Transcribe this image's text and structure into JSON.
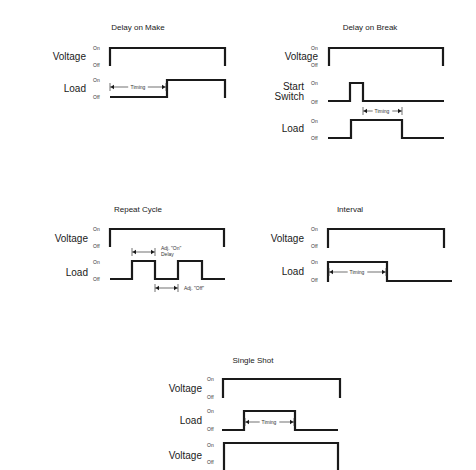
{
  "colors": {
    "line": "#1a1a1a",
    "background": "#ffffff"
  },
  "diagrams": [
    {
      "id": "delay-on-make",
      "title": "Delay on Make",
      "title_pos": [
        138,
        30
      ],
      "signals": [
        {
          "label": [
            "Voltage"
          ],
          "label_x": 86,
          "label_y": 60,
          "on_y": 50,
          "off_y": 67,
          "state_x": 93,
          "path": [
            [
              110,
              66
            ],
            [
              110,
              48
            ],
            [
              225,
              48
            ],
            [
              225,
              66
            ]
          ]
        },
        {
          "label": [
            "Load"
          ],
          "label_x": 86,
          "label_y": 92,
          "on_y": 82,
          "off_y": 99,
          "state_x": 93,
          "path": [
            [
              110,
              97
            ],
            [
              167,
              97
            ],
            [
              167,
              80
            ],
            [
              225,
              80
            ],
            [
              225,
              98
            ]
          ]
        }
      ],
      "dims": [
        {
          "x1": 110,
          "x2": 166,
          "y": 87,
          "text": "Timing",
          "text_x": 138,
          "text_y": 89,
          "inline": true,
          "tick_x1": true
        }
      ]
    },
    {
      "id": "delay-on-break",
      "title": "Delay on Break",
      "title_pos": [
        370,
        30
      ],
      "signals": [
        {
          "label": [
            "Voltage"
          ],
          "label_x": 318,
          "label_y": 60,
          "on_y": 50,
          "off_y": 67,
          "state_x": 311,
          "path": [
            [
              329,
              66
            ],
            [
              329,
              48
            ],
            [
              443,
              48
            ],
            [
              443,
              66
            ]
          ]
        },
        {
          "label": [
            "Start",
            "Switch"
          ],
          "label_x": 304,
          "label_y": 90,
          "on_y": 85,
          "off_y": 104,
          "state_x": 311,
          "path": [
            [
              328,
              101
            ],
            [
              350,
              101
            ],
            [
              350,
              83
            ],
            [
              363,
              83
            ],
            [
              363,
              101
            ],
            [
              444,
              101
            ]
          ]
        },
        {
          "label": [
            "Load"
          ],
          "label_x": 304,
          "label_y": 132,
          "on_y": 123,
          "off_y": 140,
          "state_x": 311,
          "path": [
            [
              328,
              138
            ],
            [
              351,
              138
            ],
            [
              351,
              120
            ],
            [
              402,
              120
            ],
            [
              402,
              138
            ],
            [
              444,
              138
            ]
          ]
        }
      ],
      "dims": [
        {
          "x1": 363,
          "x2": 402,
          "y": 111,
          "text": "Timing",
          "text_x": 382,
          "text_y": 113,
          "inline": true
        }
      ]
    },
    {
      "id": "repeat-cycle",
      "title": "Repeat Cycle",
      "title_pos": [
        138,
        212
      ],
      "signals": [
        {
          "label": [
            "Voltage"
          ],
          "label_x": 88,
          "label_y": 242,
          "on_y": 231,
          "off_y": 248,
          "state_x": 93,
          "path": [
            [
              110,
              247
            ],
            [
              110,
              229
            ],
            [
              224,
              229
            ],
            [
              224,
              247
            ]
          ]
        },
        {
          "label": [
            "Load"
          ],
          "label_x": 88,
          "label_y": 276,
          "on_y": 264,
          "off_y": 281,
          "state_x": 93,
          "path": [
            [
              110,
              279
            ],
            [
              132,
              279
            ],
            [
              132,
              261
            ],
            [
              155,
              261
            ],
            [
              155,
              279
            ],
            [
              178,
              279
            ],
            [
              178,
              261
            ],
            [
              202,
              261
            ],
            [
              202,
              279
            ],
            [
              225,
              279
            ]
          ]
        }
      ],
      "dims": [
        {
          "x1": 132,
          "x2": 155,
          "y": 252,
          "text": "Adj. \"On\"",
          "text2": "Delay",
          "text_x": 161,
          "text_y": 250,
          "inline": false
        },
        {
          "x1": 155,
          "x2": 178,
          "y": 288,
          "text": "Adj. \"Off\"",
          "text_x": 184,
          "text_y": 290,
          "inline": false
        }
      ]
    },
    {
      "id": "interval",
      "title": "Interval",
      "title_pos": [
        350,
        212
      ],
      "signals": [
        {
          "label": [
            "Voltage"
          ],
          "label_x": 304,
          "label_y": 242,
          "on_y": 231,
          "off_y": 248,
          "state_x": 311,
          "path": [
            [
              328,
              248
            ],
            [
              328,
              229
            ],
            [
              444,
              229
            ],
            [
              444,
              248
            ]
          ]
        },
        {
          "label": [
            "Load"
          ],
          "label_x": 304,
          "label_y": 275,
          "on_y": 264,
          "off_y": 282,
          "state_x": 311,
          "path": [
            [
              328,
              282
            ],
            [
              328,
              262
            ],
            [
              387,
              262
            ],
            [
              387,
              281
            ],
            [
              452,
              281
            ]
          ]
        }
      ],
      "dims": [
        {
          "x1": 329,
          "x2": 386,
          "y": 272,
          "text": "Timing",
          "text_x": 357,
          "text_y": 274,
          "inline": true
        }
      ]
    },
    {
      "id": "single-shot",
      "title": "Single Shot",
      "title_pos": [
        253,
        363
      ],
      "signals": [
        {
          "label": [
            "Voltage"
          ],
          "label_x": 202,
          "label_y": 392,
          "on_y": 381,
          "off_y": 399,
          "state_x": 207,
          "path": [
            [
              223,
              398
            ],
            [
              223,
              379
            ],
            [
              340,
              379
            ],
            [
              340,
              398
            ]
          ]
        },
        {
          "label": [
            "Load"
          ],
          "label_x": 202,
          "label_y": 424,
          "on_y": 413,
          "off_y": 431,
          "state_x": 207,
          "path": [
            [
              222,
              430
            ],
            [
              244,
              430
            ],
            [
              244,
              411
            ],
            [
              295,
              411
            ],
            [
              295,
              430
            ],
            [
              338,
              430
            ]
          ]
        },
        {
          "label": [
            "Voltage"
          ],
          "label_x": 202,
          "label_y": 459,
          "on_y": 447,
          "off_y": 464,
          "state_x": 207,
          "path": [
            [
              224,
              470
            ],
            [
              224,
              443
            ],
            [
              338,
              443
            ],
            [
              338,
              470
            ]
          ]
        }
      ],
      "dims": [
        {
          "x1": 245,
          "x2": 294,
          "y": 422,
          "text": "Timing",
          "text_x": 269,
          "text_y": 424,
          "inline": true
        }
      ]
    }
  ],
  "state_labels": {
    "on": "On",
    "off": "Off"
  }
}
